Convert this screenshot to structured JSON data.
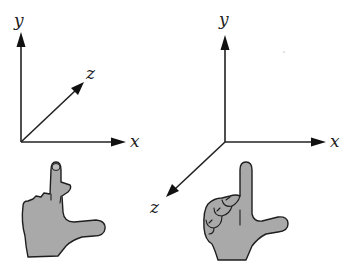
{
  "figure": {
    "colors": {
      "ink": "#222222",
      "hand_fill": "#a9a9a9",
      "background": "#ffffff"
    },
    "left_system": {
      "handedness": "left-handed",
      "z_direction": "into the page (up-right)",
      "labels": {
        "x": "x",
        "y": "y",
        "z": "z"
      }
    },
    "right_system": {
      "handedness": "right-handed",
      "z_direction": "out of the page (down-left)",
      "labels": {
        "x": "x",
        "y": "y",
        "z": "z"
      }
    }
  }
}
